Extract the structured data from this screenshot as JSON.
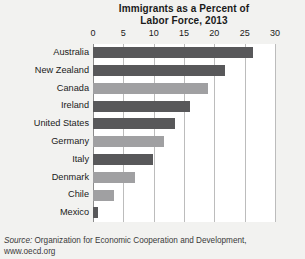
{
  "chart_data": {
    "type": "bar",
    "orientation": "horizontal",
    "title": "Immigrants as a Percent of Labor Force, 2013",
    "title_line1": "Immigrants as a Percent of",
    "title_line2": "Labor Force, 2013",
    "xlabel": "",
    "ylabel": "",
    "xlim": [
      0,
      30
    ],
    "xticks": [
      0,
      5,
      10,
      15,
      20,
      25,
      30
    ],
    "xtick_labels": [
      "0",
      "5",
      "10",
      "15",
      "20",
      "25",
      "30"
    ],
    "grid": "vertical",
    "legend": "none",
    "categories": [
      "Australia",
      "New Zealand",
      "Canada",
      "Ireland",
      "United States",
      "Germany",
      "Italy",
      "Denmark",
      "Chile",
      "Mexico"
    ],
    "values": [
      26.3,
      21.7,
      19.0,
      16.0,
      13.5,
      11.7,
      9.9,
      7.0,
      3.5,
      0.8
    ],
    "colors": {
      "dark": "#58585a",
      "light": "#a0a0a2",
      "plot_background": "#ffffff",
      "page_background": "#f2f2f0",
      "gridline": "#bcbcbc",
      "axis": "#8c8c8c",
      "text": "#1a1a1a"
    },
    "bar_colors": [
      "dark",
      "dark",
      "light",
      "dark",
      "dark",
      "light",
      "dark",
      "light",
      "light",
      "dark"
    ]
  },
  "source": {
    "lead": "Source:",
    "text": " Organization for Economic Cooperation and Development,",
    "url": "www.oecd.org"
  }
}
